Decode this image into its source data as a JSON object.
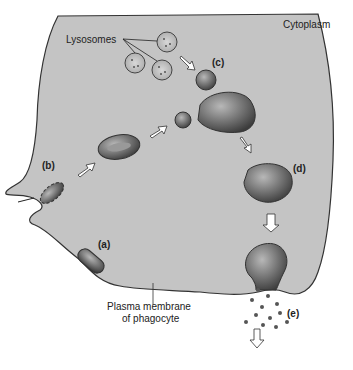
{
  "labels": {
    "cytoplasm": "Cytoplasm",
    "lysosomes": "Lysosomes",
    "membrane_line1": "Plasma membrane",
    "membrane_line2": "of phagocyte"
  },
  "stages": [
    {
      "id": "a",
      "label": "(a)"
    },
    {
      "id": "b",
      "label": "(b)"
    },
    {
      "id": "c",
      "label": "(c)"
    },
    {
      "id": "d",
      "label": "(d)"
    },
    {
      "id": "e",
      "label": "(e)"
    }
  ],
  "colors": {
    "cytoplasm": "#c4c4c4",
    "membrane": "#333333",
    "vesicle": "#6e6e6e",
    "arrow_fill": "#ffffff"
  }
}
